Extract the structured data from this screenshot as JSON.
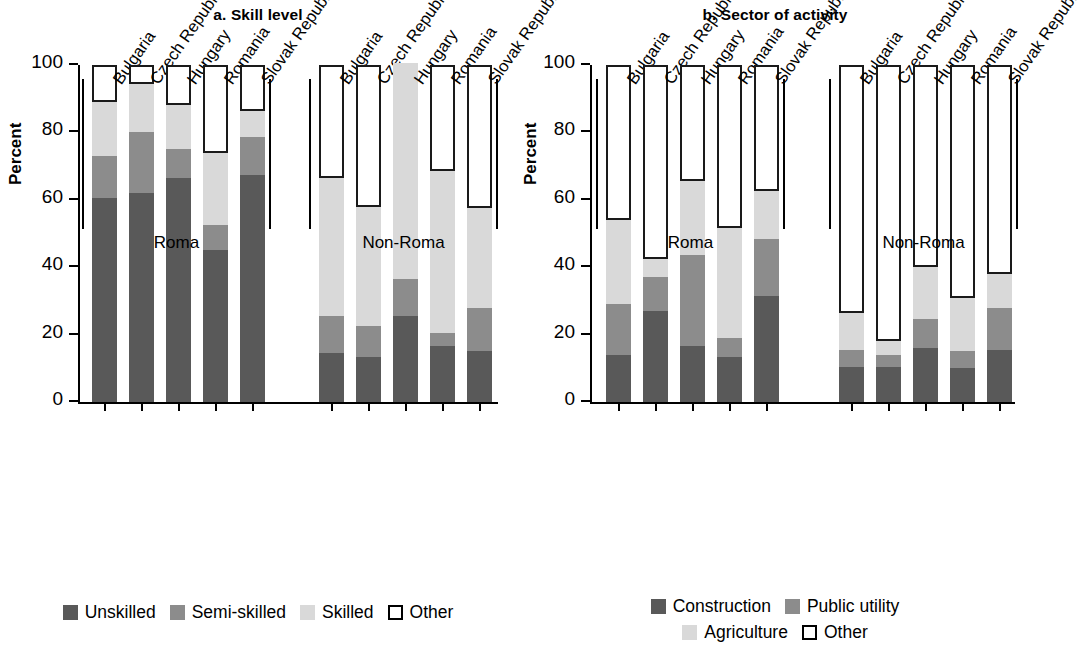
{
  "chart_data": [
    {
      "type": "bar",
      "title": "a. Skill level",
      "subtitle": "",
      "xlabel": "",
      "ylabel": "Percent",
      "ylim": [
        0,
        100
      ],
      "yticks": [
        0,
        20,
        40,
        60,
        80,
        100
      ],
      "ytick_labels": [
        "0",
        "20",
        "40",
        "60",
        "80",
        "100"
      ],
      "grid": false,
      "stacked": true,
      "legend_position": "bottom",
      "groups": [
        "Roma",
        "Non-Roma"
      ],
      "categories": [
        "Bulgaria",
        "Czech Republic",
        "Hungary",
        "Romania",
        "Slovak Republic"
      ],
      "series": [
        {
          "name": "Unskilled",
          "color": "#595959",
          "values_roma": [
            60.5,
            62.0,
            66.5,
            45.0,
            67.5
          ],
          "values_non_roma": [
            14.5,
            13.5,
            25.5,
            16.5,
            15.0
          ]
        },
        {
          "name": "Semi-skilled",
          "color": "#8c8c8c",
          "values_roma": [
            12.5,
            18.0,
            8.5,
            7.5,
            11.0
          ],
          "values_non_roma": [
            11.0,
            9.0,
            11.0,
            4.0,
            13.0
          ]
        },
        {
          "name": "Skilled",
          "color": "#d9d9d9",
          "values_roma": [
            16.0,
            14.5,
            13.0,
            21.5,
            8.0
          ],
          "values_non_roma": [
            41.0,
            35.5,
            64.0,
            48.0,
            29.5
          ]
        },
        {
          "name": "Other",
          "color": "#ffffff",
          "values_roma": [
            11.0,
            5.5,
            12.0,
            26.0,
            13.5
          ],
          "values_non_roma": [
            33.5,
            42.0,
            0.0,
            31.5,
            42.5
          ]
        }
      ]
    },
    {
      "type": "bar",
      "title": "b. Sector of activity",
      "subtitle": "",
      "xlabel": "",
      "ylabel": "Percent",
      "ylim": [
        0,
        100
      ],
      "yticks": [
        0,
        20,
        40,
        60,
        80,
        100
      ],
      "ytick_labels": [
        "0",
        "20",
        "40",
        "60",
        "80",
        "100"
      ],
      "grid": false,
      "stacked": true,
      "legend_position": "bottom",
      "groups": [
        "Roma",
        "Non-Roma"
      ],
      "categories": [
        "Bulgaria",
        "Czech Republic",
        "Hungary",
        "Romania",
        "Slovak Republic"
      ],
      "series": [
        {
          "name": "Construction",
          "color": "#595959",
          "values_roma": [
            14.0,
            27.0,
            16.5,
            13.5,
            31.5
          ],
          "values_non_roma": [
            10.5,
            10.5,
            16.0,
            10.0,
            15.5
          ]
        },
        {
          "name": "Public utility",
          "color": "#8c8c8c",
          "values_roma": [
            15.0,
            10.0,
            27.0,
            5.5,
            17.0
          ],
          "values_non_roma": [
            5.0,
            3.5,
            8.5,
            5.0,
            12.5
          ]
        },
        {
          "name": "Agriculture",
          "color": "#d9d9d9",
          "values_roma": [
            25.0,
            5.5,
            22.0,
            32.5,
            14.0
          ],
          "values_non_roma": [
            11.0,
            4.0,
            15.5,
            16.0,
            10.0
          ]
        },
        {
          "name": "Other",
          "color": "#ffffff",
          "values_roma": [
            46.0,
            57.5,
            34.5,
            48.5,
            37.5
          ],
          "values_non_roma": [
            73.5,
            82.0,
            60.0,
            69.0,
            62.0
          ]
        }
      ]
    }
  ],
  "panel_a": {
    "title": "a. Skill level",
    "y_axis_title": "Percent",
    "y_ticks": [
      "100",
      "80",
      "60",
      "40",
      "20",
      "0"
    ],
    "groups": [
      {
        "label": "Roma",
        "categories": [
          "Bulgaria",
          "Czech Republic",
          "Hungary",
          "Romania",
          "Slovak Republic"
        ]
      },
      {
        "label": "Non-Roma",
        "categories": [
          "Bulgaria",
          "Czech Republic",
          "Hungary",
          "Romania",
          "Slovak Republic"
        ]
      }
    ],
    "legend": [
      {
        "label": "Unskilled",
        "color": "#595959",
        "style": "fill"
      },
      {
        "label": "Semi-skilled",
        "color": "#8c8c8c",
        "style": "fill"
      },
      {
        "label": "Skilled",
        "color": "#d9d9d9",
        "style": "fill"
      },
      {
        "label": "Other",
        "color": "#ffffff",
        "style": "outline"
      }
    ]
  },
  "panel_b": {
    "title": "b. Sector of activity",
    "y_axis_title": "Percent",
    "y_ticks": [
      "100",
      "80",
      "60",
      "40",
      "20",
      "0"
    ],
    "groups": [
      {
        "label": "Roma",
        "categories": [
          "Bulgaria",
          "Czech Republic",
          "Hungary",
          "Romania",
          "Slovak Republic"
        ]
      },
      {
        "label": "Non-Roma",
        "categories": [
          "Bulgaria",
          "Czech Republic",
          "Hungary",
          "Romania",
          "Slovak Republic"
        ]
      }
    ],
    "legend_row1": [
      {
        "label": "Construction",
        "color": "#595959",
        "style": "fill"
      },
      {
        "label": "Public utility",
        "color": "#8c8c8c",
        "style": "fill"
      }
    ],
    "legend_row2": [
      {
        "label": "Agriculture",
        "color": "#d9d9d9",
        "style": "fill"
      },
      {
        "label": "Other",
        "color": "#ffffff",
        "style": "outline"
      }
    ]
  }
}
